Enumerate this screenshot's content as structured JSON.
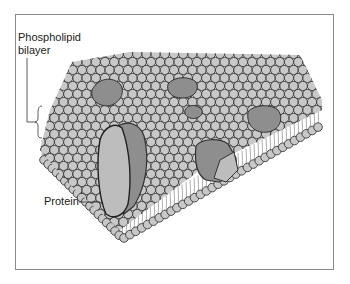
{
  "figure": {
    "labels": {
      "bilayer_line1": "Phospholipid",
      "bilayer_line2": "bilayer",
      "protein": "Protein"
    },
    "colors": {
      "head_fill": "#c8c8c8",
      "head_stroke": "#3a3a3a",
      "tail_stroke": "#777777",
      "protein_dark": "#8e8e8e",
      "protein_light": "#bdbdbd",
      "frame": "#8a8a8a"
    }
  }
}
